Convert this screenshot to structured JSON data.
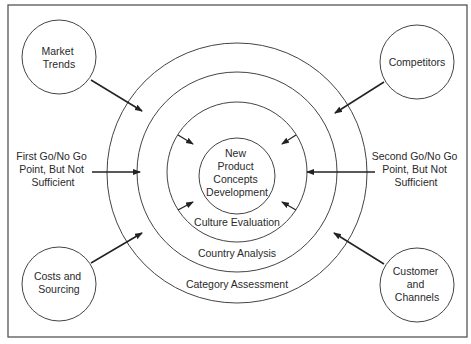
{
  "diagram": {
    "center": {
      "lines": [
        "New",
        "Product",
        "Concepts",
        "Development"
      ]
    },
    "rings": [
      {
        "label": "Culture Evaluation"
      },
      {
        "label": "Country Analysis"
      },
      {
        "label": "Category Assessment"
      }
    ],
    "external_factors": [
      {
        "position": "top-left",
        "lines": [
          "Market",
          "Trends"
        ]
      },
      {
        "position": "top-right",
        "lines": [
          "Competitors"
        ]
      },
      {
        "position": "bottom-left",
        "lines": [
          "Costs and",
          "Sourcing"
        ]
      },
      {
        "position": "bottom-right",
        "lines": [
          "Customer",
          "and",
          "Channels"
        ]
      }
    ],
    "decision_points": [
      {
        "position": "left",
        "lines": [
          "First Go/No Go",
          "Point, But Not",
          "Sufficient"
        ]
      },
      {
        "position": "right",
        "lines": [
          "Second Go/No Go",
          "Point, But Not",
          "Sufficient"
        ]
      }
    ],
    "colors": {
      "stroke": "#333333",
      "text": "#2a2a2a",
      "background": "#ffffff"
    }
  }
}
